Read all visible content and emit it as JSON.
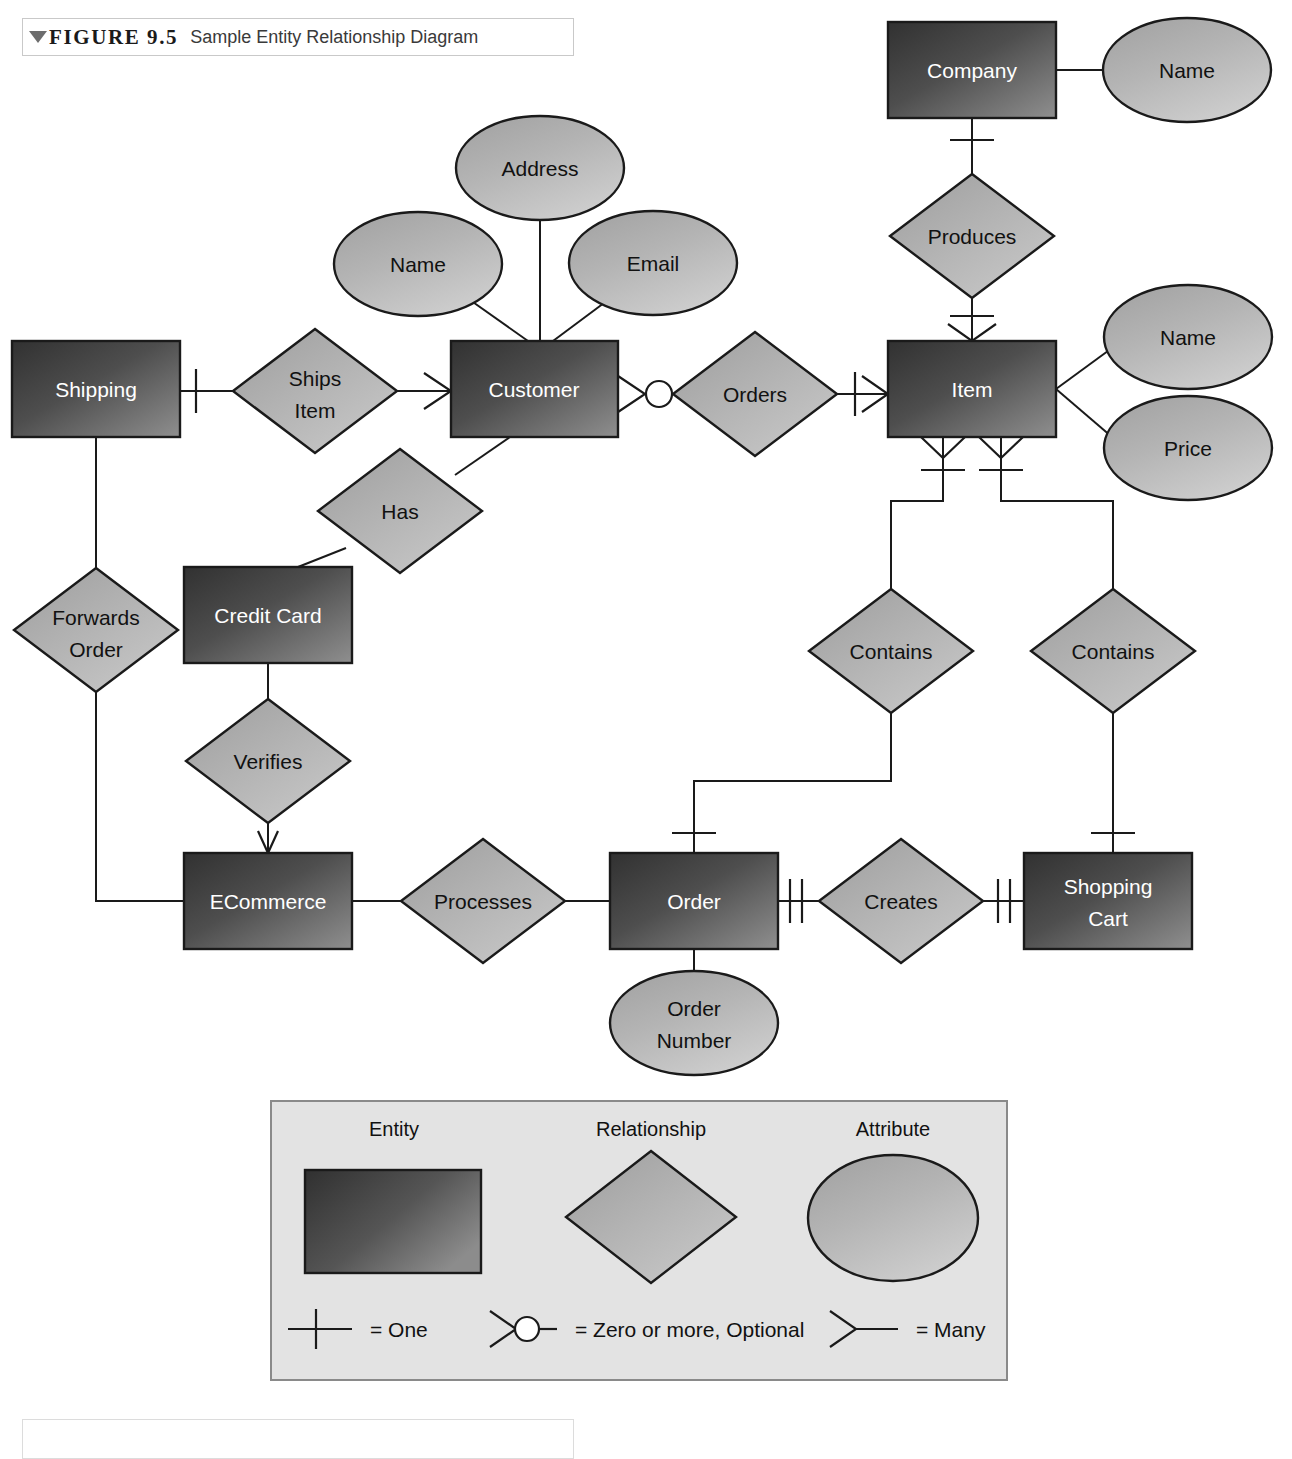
{
  "figure": {
    "marker_icon": "triangle-down-icon",
    "number": "FIGURE 9.5",
    "title": "Sample Entity Relationship Diagram"
  },
  "colors": {
    "entity_fill_dark": "#3b3b3b",
    "entity_fill_light": "#8d8d8d",
    "relationship_fill_dark": "#a3a3a3",
    "relationship_fill_light": "#c4c4c4",
    "attribute_fill_dark": "#a6a6a6",
    "attribute_fill_light": "#c9c9c9",
    "outline": "#1a1a1a",
    "entity_text": "#ffffff",
    "shape_text": "#111111",
    "legend_panel_fill": "#e3e3e3",
    "legend_panel_border": "#8a8a8a",
    "page_background": "#ffffff"
  },
  "diagram": {
    "entities": [
      {
        "id": "company",
        "label": "Company",
        "x": 888,
        "y": 22,
        "w": 168,
        "h": 96
      },
      {
        "id": "item",
        "label": "Item",
        "x": 888,
        "y": 341,
        "w": 168,
        "h": 96
      },
      {
        "id": "customer",
        "label": "Customer",
        "x": 451,
        "y": 341,
        "w": 167,
        "h": 96
      },
      {
        "id": "shipping",
        "label": "Shipping",
        "x": 12,
        "y": 341,
        "w": 168,
        "h": 96
      },
      {
        "id": "credit-card",
        "label": "Credit Card",
        "x": 184,
        "y": 567,
        "w": 168,
        "h": 96
      },
      {
        "id": "ecommerce",
        "label": "ECommerce",
        "x": 184,
        "y": 853,
        "w": 168,
        "h": 96
      },
      {
        "id": "order",
        "label": "Order",
        "x": 610,
        "y": 853,
        "w": 168,
        "h": 96
      },
      {
        "id": "shopping-cart",
        "label": "Shopping Cart",
        "x": 1024,
        "y": 853,
        "w": 168,
        "h": 96,
        "lines": [
          "Shopping",
          "Cart"
        ]
      }
    ],
    "relationships": [
      {
        "id": "produces",
        "label": "Produces",
        "cx": 972,
        "cy": 236,
        "rx": 82,
        "ry": 62
      },
      {
        "id": "orders",
        "label": "Orders",
        "cx": 755,
        "cy": 394,
        "rx": 82,
        "ry": 62
      },
      {
        "id": "ships-item",
        "label": "Ships Item",
        "cx": 315,
        "cy": 391,
        "rx": 82,
        "ry": 62,
        "lines": [
          "Ships",
          "Item"
        ]
      },
      {
        "id": "has",
        "label": "Has",
        "cx": 400,
        "cy": 511,
        "rx": 82,
        "ry": 62
      },
      {
        "id": "forwards-order",
        "label": "Forwards Order",
        "cx": 96,
        "cy": 630,
        "rx": 82,
        "ry": 62,
        "lines": [
          "Forwards",
          "Order"
        ]
      },
      {
        "id": "verifies",
        "label": "Verifies",
        "cx": 268,
        "cy": 761,
        "rx": 82,
        "ry": 62
      },
      {
        "id": "contains-left",
        "label": "Contains",
        "cx": 891,
        "cy": 651,
        "rx": 82,
        "ry": 62
      },
      {
        "id": "contains-right",
        "label": "Contains",
        "cx": 1113,
        "cy": 651,
        "rx": 82,
        "ry": 62
      },
      {
        "id": "processes",
        "label": "Processes",
        "cx": 483,
        "cy": 901,
        "rx": 82,
        "ry": 62
      },
      {
        "id": "creates",
        "label": "Creates",
        "cx": 901,
        "cy": 901,
        "rx": 82,
        "ry": 62
      }
    ],
    "attributes": [
      {
        "id": "company-name",
        "label": "Name",
        "cx": 1187,
        "cy": 70,
        "rx": 84,
        "ry": 52
      },
      {
        "id": "item-name",
        "label": "Name",
        "cx": 1188,
        "cy": 337,
        "rx": 84,
        "ry": 52
      },
      {
        "id": "item-price",
        "label": "Price",
        "cx": 1188,
        "cy": 448,
        "rx": 84,
        "ry": 52
      },
      {
        "id": "cust-address",
        "label": "Address",
        "cx": 540,
        "cy": 168,
        "rx": 84,
        "ry": 52
      },
      {
        "id": "cust-name",
        "label": "Name",
        "cx": 418,
        "cy": 264,
        "rx": 84,
        "ry": 52
      },
      {
        "id": "cust-email",
        "label": "Email",
        "cx": 653,
        "cy": 263,
        "rx": 84,
        "ry": 52
      },
      {
        "id": "order-number",
        "label": "Order Number",
        "cx": 694,
        "cy": 1023,
        "rx": 84,
        "ry": 52,
        "lines": [
          "Order",
          "Number"
        ]
      }
    ]
  },
  "legend": {
    "panel": {
      "x": 271,
      "y": 1101,
      "w": 736,
      "h": 279
    },
    "headings": [
      {
        "id": "legend-entity",
        "label": "Entity",
        "cx": 394,
        "cy": 1131
      },
      {
        "id": "legend-relationship",
        "label": "Relationship",
        "cx": 651,
        "cy": 1131
      },
      {
        "id": "legend-attribute",
        "label": "Attribute",
        "cx": 893,
        "cy": 1131
      }
    ],
    "samples": {
      "entity_rect": {
        "x": 305,
        "y": 1170,
        "w": 176,
        "h": 103
      },
      "relationship_diamond": {
        "cx": 651,
        "cy": 1217,
        "rx": 85,
        "ry": 66
      },
      "attribute_ellipse": {
        "cx": 893,
        "cy": 1218,
        "rx": 85,
        "ry": 63
      }
    },
    "notations": [
      {
        "id": "notation-one",
        "symbol": "one-bar-icon",
        "label": "= One",
        "x": 288,
        "y": 1329,
        "text_x": 370
      },
      {
        "id": "notation-zero-more",
        "symbol": "crowsfoot-circle-icon",
        "label": "= Zero or more, Optional",
        "x": 490,
        "y": 1329,
        "text_x": 575
      },
      {
        "id": "notation-many",
        "symbol": "crowsfoot-icon",
        "label": "= Many",
        "x": 830,
        "y": 1329,
        "text_x": 916
      }
    ]
  }
}
